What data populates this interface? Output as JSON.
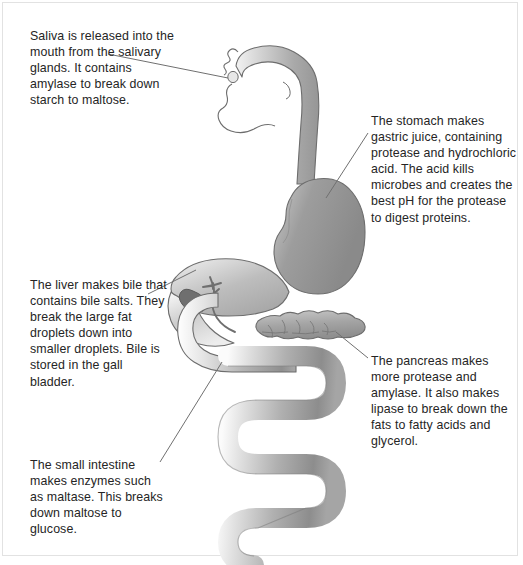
{
  "diagram": {
    "colors": {
      "text": "#252525",
      "leader_line": "#6b6b6b",
      "outline": "#5a5a5a",
      "organ_light": "#d9d9d9",
      "organ_mid": "#b6b6b6",
      "organ_dark": "#9a9a9a",
      "stomach": "#8e8e8e",
      "gall_bladder": "#707070",
      "background": "#ffffff",
      "frame": "#e2e2e2"
    },
    "annotations": [
      {
        "id": "saliva",
        "organ": "salivary-glands",
        "text": "Saliva is released into the mouth from the salivary glands. It contains amylase to break down starch to maltose."
      },
      {
        "id": "stomach",
        "organ": "stomach",
        "text": "The stomach makes gastric juice, containing protease and hydrochloric acid. The acid kills microbes and creates the best pH for the protease to digest proteins."
      },
      {
        "id": "liver",
        "organ": "liver",
        "text": "The liver makes bile that contains bile salts. They break the large fat droplets down into smaller droplets. Bile is stored in the gall bladder."
      },
      {
        "id": "pancreas",
        "organ": "pancreas",
        "text": "The pancreas makes more protease and amylase. It also makes lipase to break down the fats to fatty acids and glycerol."
      },
      {
        "id": "intestine",
        "organ": "small-intestine",
        "text": "The small intestine makes enzymes such as maltase. This breaks down maltose to glucose."
      }
    ],
    "organ_labels": {
      "mouth": "mouth",
      "oesophagus": "oesophagus",
      "stomach": "stomach",
      "liver": "liver",
      "gall_bladder": "gall bladder",
      "bile_duct": "bile duct",
      "pancreas": "pancreas",
      "small_intestine": "small intestine"
    }
  }
}
